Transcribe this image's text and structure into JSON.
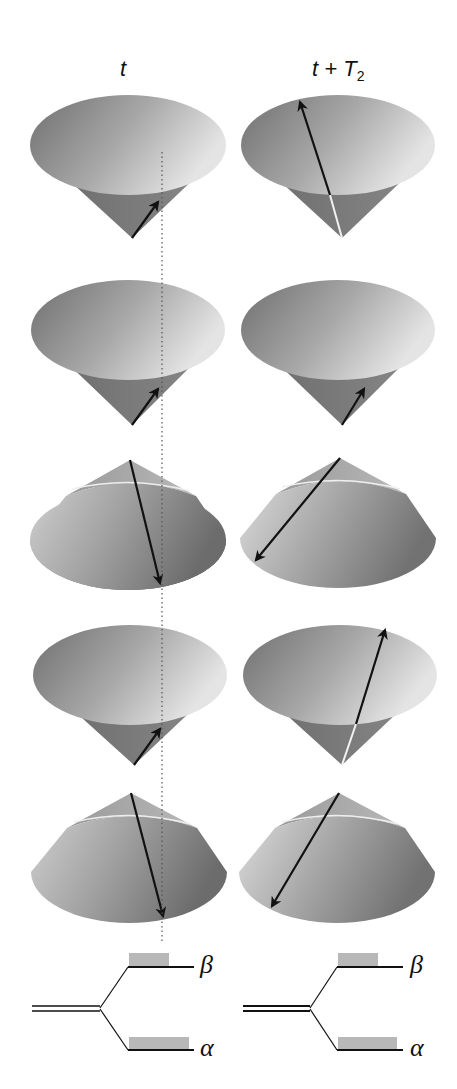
{
  "columns": [
    {
      "label_main": "t",
      "label_sub": ""
    },
    {
      "label_main": "t + T",
      "label_sub": "2"
    }
  ],
  "energy_levels": {
    "upper": "β",
    "lower": "α"
  },
  "colors": {
    "cone_dark": "#6e6e6e",
    "cone_light": "#d9d9d9",
    "cone_side": "#7a7a7a",
    "arrow": "#111111",
    "population_bar": "#b8b8b8"
  },
  "rows": [
    {
      "orientation": "apex-down",
      "left_arrow": "short-up-right",
      "right_arrow": "long-up-left"
    },
    {
      "orientation": "apex-down",
      "left_arrow": "short-up-right",
      "right_arrow": "short-up-right"
    },
    {
      "orientation": "apex-up",
      "left_arrow": "long-down-right",
      "right_arrow": "long-down-left"
    },
    {
      "orientation": "apex-down",
      "left_arrow": "short-up-right",
      "right_arrow": "long-up-right"
    },
    {
      "orientation": "apex-up",
      "left_arrow": "long-down-right",
      "right_arrow": "long-down-left"
    }
  ]
}
